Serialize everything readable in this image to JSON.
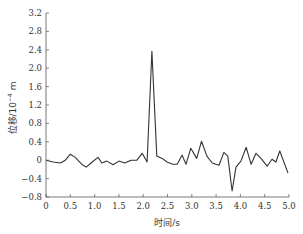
{
  "chart_data": {
    "type": "line",
    "title": "",
    "xlabel": "时间/s",
    "ylabel": "位移/10⁻⁴ m",
    "ylabel_parts": {
      "prefix": "位移/10",
      "exp": "−4",
      "suffix": " m"
    },
    "xlim": [
      0,
      5.0
    ],
    "ylim": [
      -0.8,
      3.2
    ],
    "x_ticks": [
      0,
      0.5,
      1.0,
      1.5,
      2.0,
      2.5,
      3.0,
      3.5,
      4.0,
      4.5,
      5.0
    ],
    "x_tick_labels": [
      "0",
      "0.5",
      "1.0",
      "1.5",
      "2.0",
      "2.5",
      "3.0",
      "3.5",
      "4.0",
      "4.5",
      "5.0"
    ],
    "y_ticks": [
      3.2,
      2.8,
      2.4,
      2.0,
      1.6,
      1.2,
      0.8,
      0.4,
      0,
      -0.4,
      -0.8
    ],
    "y_tick_labels": [
      "3.2",
      "2.8",
      "2.4",
      "2.0",
      "1.6",
      "1.2",
      "0.8",
      "0.4",
      "0",
      "−0.4",
      "−0.8"
    ],
    "grid": false,
    "legend": null,
    "series": [
      {
        "name": "位移",
        "color": "#333333",
        "x": [
          0,
          0.15,
          0.3,
          0.4,
          0.5,
          0.6,
          0.75,
          0.83,
          0.95,
          1.07,
          1.15,
          1.25,
          1.38,
          1.5,
          1.62,
          1.75,
          1.87,
          1.98,
          2.08,
          2.18,
          2.28,
          2.39,
          2.49,
          2.61,
          2.7,
          2.8,
          2.88,
          2.98,
          3.1,
          3.2,
          3.31,
          3.42,
          3.56,
          3.66,
          3.74,
          3.83,
          3.91,
          4.01,
          4.12,
          4.22,
          4.32,
          4.44,
          4.55,
          4.65,
          4.73,
          4.81,
          4.98
        ],
        "values": [
          0,
          -0.04,
          -0.06,
          0,
          0.13,
          0.06,
          -0.1,
          -0.15,
          -0.04,
          0.06,
          -0.06,
          -0.02,
          -0.1,
          -0.02,
          -0.06,
          0,
          0,
          0.15,
          -0.04,
          2.37,
          0.09,
          0.04,
          -0.04,
          -0.09,
          -0.09,
          0.11,
          -0.09,
          0.26,
          0.04,
          0.41,
          0.09,
          -0.06,
          -0.11,
          0.17,
          0.09,
          -0.67,
          -0.15,
          -0.02,
          0.28,
          -0.09,
          0.15,
          0.02,
          -0.13,
          0.02,
          -0.04,
          0.2,
          -0.28
        ]
      }
    ]
  }
}
